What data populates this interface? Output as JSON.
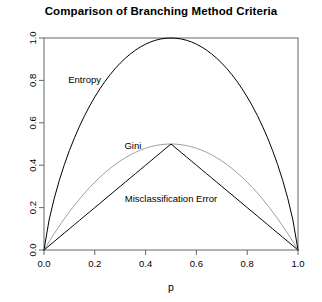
{
  "chart_data": {
    "type": "line",
    "title": "Comparison of Branching Method Criteria",
    "xlabel": "p",
    "ylabel": "",
    "xlim": [
      0.0,
      1.0
    ],
    "ylim": [
      0.0,
      1.0
    ],
    "grid": false,
    "legend_position": "inline-annotations",
    "x_ticks": [
      "0.0",
      "0.2",
      "0.4",
      "0.6",
      "0.8",
      "1.0"
    ],
    "x_tick_values": [
      0.0,
      0.2,
      0.4,
      0.6,
      0.8,
      1.0
    ],
    "y_ticks": [
      "0.0",
      "0.2",
      "0.4",
      "0.6",
      "0.8",
      "1.0"
    ],
    "y_tick_values": [
      0.0,
      0.2,
      0.4,
      0.6,
      0.8,
      1.0
    ],
    "x": [
      0.0,
      0.02,
      0.04,
      0.06,
      0.08,
      0.1,
      0.12,
      0.14,
      0.16,
      0.18,
      0.2,
      0.22,
      0.24,
      0.26,
      0.28,
      0.3,
      0.32,
      0.34,
      0.36,
      0.38,
      0.4,
      0.42,
      0.44,
      0.46,
      0.48,
      0.5,
      0.52,
      0.54,
      0.56,
      0.58,
      0.6,
      0.62,
      0.64,
      0.66,
      0.68,
      0.7,
      0.72,
      0.74,
      0.76,
      0.78,
      0.8,
      0.82,
      0.84,
      0.86,
      0.88,
      0.9,
      0.92,
      0.94,
      0.96,
      0.98,
      1.0
    ],
    "series": [
      {
        "name": "Entropy",
        "color": "#000000",
        "label_x": 0.16,
        "label_y": 0.79,
        "formula": "-p*log2(p) - (1-p)*log2(1-p)",
        "values": [
          0.0,
          0.1414,
          0.2423,
          0.3274,
          0.4022,
          0.469,
          0.5294,
          0.5842,
          0.6343,
          0.6801,
          0.7219,
          0.7602,
          0.795,
          0.8267,
          0.8555,
          0.8813,
          0.9044,
          0.9248,
          0.9427,
          0.958,
          0.971,
          0.9815,
          0.9896,
          0.9954,
          0.9988,
          1.0,
          0.9988,
          0.9954,
          0.9896,
          0.9815,
          0.971,
          0.958,
          0.9427,
          0.9248,
          0.9044,
          0.8813,
          0.8555,
          0.8267,
          0.795,
          0.7602,
          0.7219,
          0.6801,
          0.6343,
          0.5842,
          0.5294,
          0.469,
          0.4022,
          0.3274,
          0.2423,
          0.1414,
          0.0
        ]
      },
      {
        "name": "Gini",
        "color": "#a0a0a0",
        "label_x": 0.35,
        "label_y": 0.475,
        "formula": "2*p*(1-p)",
        "values": [
          0.0,
          0.0392,
          0.0768,
          0.1128,
          0.1472,
          0.18,
          0.2112,
          0.2408,
          0.2688,
          0.2952,
          0.32,
          0.3432,
          0.3648,
          0.3848,
          0.4032,
          0.42,
          0.4352,
          0.4488,
          0.4608,
          0.4712,
          0.48,
          0.4872,
          0.4928,
          0.4968,
          0.4992,
          0.5,
          0.4992,
          0.4968,
          0.4928,
          0.4872,
          0.48,
          0.4712,
          0.4608,
          0.4488,
          0.4352,
          0.42,
          0.4032,
          0.3848,
          0.3648,
          0.3432,
          0.32,
          0.2952,
          0.2688,
          0.2408,
          0.2112,
          0.18,
          0.1472,
          0.1128,
          0.0768,
          0.0392,
          0.0
        ]
      },
      {
        "name": "Misclassification Error",
        "color": "#000000",
        "label_x": 0.5,
        "label_y": 0.225,
        "formula": "min(p, 1-p)",
        "values": [
          0.0,
          0.02,
          0.04,
          0.06,
          0.08,
          0.1,
          0.12,
          0.14,
          0.16,
          0.18,
          0.2,
          0.22,
          0.24,
          0.26,
          0.28,
          0.3,
          0.32,
          0.34,
          0.36,
          0.38,
          0.4,
          0.42,
          0.44,
          0.46,
          0.48,
          0.5,
          0.48,
          0.46,
          0.44,
          0.42,
          0.4,
          0.38,
          0.36,
          0.34,
          0.32,
          0.3,
          0.28,
          0.26,
          0.24,
          0.22,
          0.2,
          0.18,
          0.16,
          0.14,
          0.12,
          0.1,
          0.08,
          0.06,
          0.04,
          0.02,
          0.0
        ]
      }
    ]
  },
  "axis": {
    "frame_color": "#666666"
  }
}
